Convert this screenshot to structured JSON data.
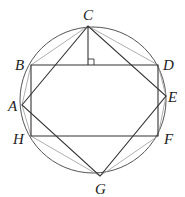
{
  "diagram": {
    "type": "geometry",
    "colors": {
      "stroke_dark": "#333333",
      "stroke_light": "#9a9a9a",
      "circle": "#555555",
      "label": "#222222"
    },
    "circle": {
      "cx": 93,
      "cy": 100,
      "r": 73
    },
    "points": [
      {
        "name": "C",
        "x": 88,
        "y": 26,
        "label": "C",
        "lx": 83,
        "ly": 20
      },
      {
        "name": "B",
        "x": 31,
        "y": 65,
        "label": "B",
        "lx": 15,
        "ly": 70
      },
      {
        "name": "D",
        "x": 158,
        "y": 65,
        "label": "D",
        "lx": 163,
        "ly": 70
      },
      {
        "name": "A",
        "x": 22,
        "y": 105,
        "label": "A",
        "lx": 8,
        "ly": 111
      },
      {
        "name": "E",
        "x": 166,
        "y": 96,
        "label": "E",
        "lx": 167,
        "ly": 102
      },
      {
        "name": "H",
        "x": 31,
        "y": 136,
        "label": "H",
        "lx": 13,
        "ly": 144
      },
      {
        "name": "F",
        "x": 158,
        "y": 136,
        "label": "F",
        "lx": 164,
        "ly": 144
      },
      {
        "name": "G",
        "x": 100,
        "y": 176,
        "label": "G",
        "lx": 95,
        "ly": 193
      }
    ],
    "foot": {
      "x": 88,
      "y": 65
    },
    "labels": {
      "A": "A",
      "B": "B",
      "C": "C",
      "D": "D",
      "E": "E",
      "F": "F",
      "G": "G",
      "H": "H"
    }
  }
}
